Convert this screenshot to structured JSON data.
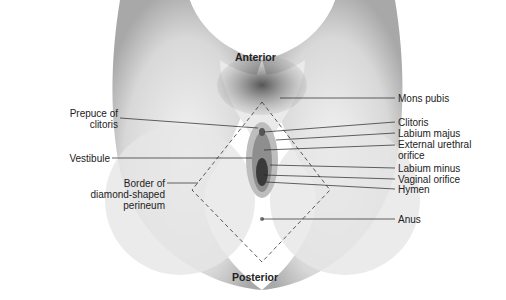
{
  "diagram": {
    "orientation": {
      "top": "Anterior",
      "bottom": "Posterior"
    },
    "labels_left": [
      {
        "text": "Prepuce of\nclitoris",
        "lines": [
          "Prepuce of",
          "clitoris"
        ]
      },
      {
        "text": "Vestibule",
        "lines": [
          "Vestibule"
        ]
      },
      {
        "text": "Border of\ndiamond-shaped\nperineum",
        "lines": [
          "Border of",
          "diamond-shaped",
          "perineum"
        ]
      }
    ],
    "labels_right": [
      {
        "text": "Mons pubis"
      },
      {
        "text": "Clitoris"
      },
      {
        "text": "Labium majus"
      },
      {
        "text": "External urethral",
        "line2": "orifice"
      },
      {
        "text": "Labium minus"
      },
      {
        "text": "Vaginal orifice"
      },
      {
        "text": "Hymen"
      },
      {
        "text": "Anus"
      }
    ]
  }
}
